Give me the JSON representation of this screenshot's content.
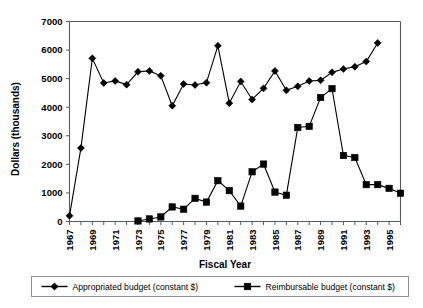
{
  "chart_data": {
    "type": "line",
    "title": "",
    "xlabel": "Fiscal Year",
    "ylabel": "Dollars (thousands)",
    "ylim": [
      0,
      7000
    ],
    "ytick_labels": [
      "0",
      "1000",
      "2000",
      "3000",
      "4000",
      "5000",
      "6000",
      "7000"
    ],
    "yticks": [
      0,
      1000,
      2000,
      3000,
      4000,
      5000,
      6000,
      7000
    ],
    "xlim": [
      1967,
      1996
    ],
    "xtick_labels": [
      "1967",
      "1969",
      "1971",
      "1973",
      "1975",
      "1977",
      "1979",
      "1981",
      "1983",
      "1985",
      "1987",
      "1989",
      "1991",
      "1993",
      "1995"
    ],
    "xticks_major": [
      1967,
      1969,
      1971,
      1973,
      1975,
      1977,
      1979,
      1981,
      1983,
      1985,
      1987,
      1989,
      1991,
      1993,
      1995
    ],
    "xticks_all": [
      1967,
      1968,
      1969,
      1970,
      1971,
      1972,
      1973,
      1974,
      1975,
      1976,
      1977,
      1978,
      1979,
      1980,
      1981,
      1982,
      1983,
      1984,
      1985,
      1986,
      1987,
      1988,
      1989,
      1990,
      1991,
      1992,
      1993,
      1994,
      1995,
      1996
    ],
    "grid": false,
    "legend_position": "bottom",
    "series": [
      {
        "name": "Appropriated budget (constant $)",
        "marker": "diamond",
        "color": "#000000",
        "x": [
          1967,
          1968,
          1969,
          1970,
          1971,
          1972,
          1973,
          1974,
          1975,
          1976,
          1977,
          1978,
          1979,
          1980,
          1981,
          1982,
          1983,
          1984,
          1985,
          1986,
          1987,
          1988,
          1989,
          1990,
          1991,
          1992,
          1993,
          1994
        ],
        "values": [
          200,
          2570,
          5710,
          4850,
          4920,
          4790,
          5240,
          5270,
          5100,
          4050,
          4810,
          4780,
          4860,
          6150,
          4140,
          4900,
          4270,
          4660,
          5270,
          4590,
          4730,
          4920,
          4940,
          5220,
          5340,
          5420,
          5600,
          6250
        ]
      },
      {
        "name": "Reimbursable budget (constant $)",
        "marker": "square",
        "color": "#000000",
        "x": [
          1973,
          1974,
          1975,
          1976,
          1977,
          1978,
          1979,
          1980,
          1981,
          1982,
          1983,
          1984,
          1985,
          1986,
          1987,
          1988,
          1989,
          1990,
          1991,
          1992,
          1993,
          1994,
          1995,
          1996
        ],
        "values": [
          20,
          90,
          160,
          510,
          430,
          810,
          680,
          1430,
          1080,
          540,
          1740,
          2010,
          1030,
          920,
          3290,
          3330,
          4340,
          4650,
          2310,
          2240,
          1290,
          1290,
          1160,
          990
        ]
      }
    ]
  },
  "legend": {
    "items": [
      {
        "label": "Appropriated budget (constant $)",
        "marker": "diamond"
      },
      {
        "label": "Reimbursable budget (constant $)",
        "marker": "square"
      }
    ]
  }
}
